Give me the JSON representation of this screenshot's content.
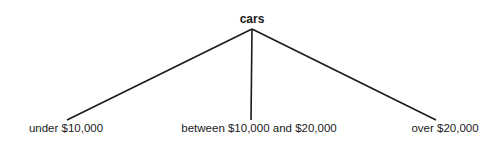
{
  "tree": {
    "root": {
      "label": "cars"
    },
    "children": [
      {
        "label": "under $10,000"
      },
      {
        "label": "between $10,000 and $20,000"
      },
      {
        "label": "over $20,000"
      }
    ],
    "line_color": "#1a1a1a"
  }
}
